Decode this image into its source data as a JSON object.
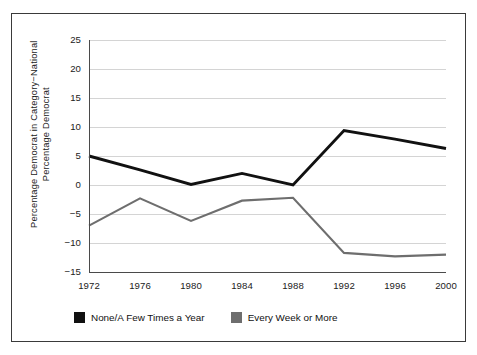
{
  "chart_data": {
    "type": "line",
    "title": "",
    "xlabel": "",
    "ylabel": "Percentage Democrat in Category−National\nPercentage Democrat",
    "categories": [
      "1972",
      "1976",
      "1980",
      "1984",
      "1988",
      "1992",
      "1996",
      "2000"
    ],
    "x": [
      1972,
      1976,
      1980,
      1984,
      1988,
      1992,
      1996,
      2000
    ],
    "ylim": [
      -15,
      25
    ],
    "xlim": [
      1972,
      2000
    ],
    "yticks": [
      "25",
      "20",
      "15",
      "10",
      "5",
      "0",
      "−5",
      "−10",
      "−15"
    ],
    "ytick_values": [
      25,
      20,
      15,
      10,
      5,
      0,
      -5,
      -10,
      -15
    ],
    "grid": true,
    "legend_position": "below-left",
    "series": [
      {
        "name": "None/A Few Times a Year",
        "color": "#111111",
        "values": [
          5.0,
          2.6,
          0.1,
          2.0,
          0.0,
          9.4,
          7.9,
          6.3
        ]
      },
      {
        "name": "Every Week or More",
        "color": "#6e6e6e",
        "values": [
          -7.0,
          -2.3,
          -6.2,
          -2.7,
          -2.2,
          -11.7,
          -12.3,
          -12.0
        ]
      }
    ]
  },
  "legend": {
    "items": [
      {
        "label": "None/A Few Times a Year",
        "color": "#111111"
      },
      {
        "label": "Every Week or More",
        "color": "#6e6e6e"
      }
    ]
  }
}
